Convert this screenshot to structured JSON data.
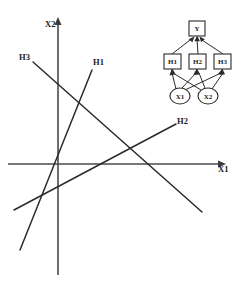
{
  "figure": {
    "background_color": "#ffffff",
    "line_color": "#2b2b2b",
    "axis_color": "#4a4a4a"
  },
  "plot": {
    "axes": {
      "x_axis_label": "X1",
      "y_axis_label": "X2",
      "origin": {
        "x": 58,
        "y": 164
      },
      "x_axis": {
        "x1": 8,
        "y1": 164,
        "x2": 222,
        "y2": 164
      },
      "y_axis": {
        "x1": 58,
        "y1": 275,
        "x2": 58,
        "y2": 21
      }
    },
    "boundaries": [
      {
        "label": "H1",
        "label_x": 93,
        "label_y": 65,
        "x1": 92,
        "y1": 70,
        "x2": 20,
        "y2": 250
      },
      {
        "label": "H2",
        "label_x": 178,
        "label_y": 124,
        "x1": 14,
        "y1": 210,
        "x2": 176,
        "y2": 124
      },
      {
        "label": "H3",
        "label_x": 20,
        "label_y": 60,
        "x1": 33,
        "y1": 62,
        "x2": 202,
        "y2": 212
      }
    ]
  },
  "network": {
    "output_node": {
      "label": "Y",
      "shape": "square",
      "x": 191,
      "y": 21,
      "w": 16,
      "h": 15
    },
    "hidden_nodes": [
      {
        "label": "H1",
        "shape": "square",
        "x": 166,
        "y": 55,
        "w": 17,
        "h": 14
      },
      {
        "label": "H2",
        "shape": "square",
        "x": 191,
        "y": 55,
        "w": 17,
        "h": 14
      },
      {
        "label": "H3",
        "shape": "square",
        "x": 216,
        "y": 55,
        "w": 17,
        "h": 14
      }
    ],
    "input_nodes": [
      {
        "label": "X1",
        "shape": "circle",
        "cx": 180,
        "cy": 96,
        "rx": 10,
        "ry": 8
      },
      {
        "label": "X2",
        "shape": "circle",
        "cx": 208,
        "cy": 96,
        "rx": 10,
        "ry": 8
      }
    ],
    "edges": [
      {
        "from": "X1",
        "to": "H1"
      },
      {
        "from": "X1",
        "to": "H2"
      },
      {
        "from": "X1",
        "to": "H3"
      },
      {
        "from": "X2",
        "to": "H1"
      },
      {
        "from": "X2",
        "to": "H2"
      },
      {
        "from": "X2",
        "to": "H3"
      },
      {
        "from": "H1",
        "to": "Y"
      },
      {
        "from": "H2",
        "to": "Y"
      },
      {
        "from": "H3",
        "to": "Y"
      }
    ]
  }
}
